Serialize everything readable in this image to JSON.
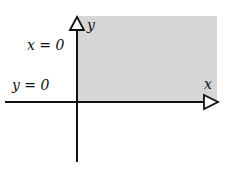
{
  "diagram": {
    "axes": {
      "x_label": "x",
      "y_label": "y"
    },
    "boundary_labels": {
      "y_axis_line": "x = 0",
      "x_axis_line": "y = 0"
    },
    "shading_color": "#d6d6d6",
    "line_color": "#111111"
  }
}
